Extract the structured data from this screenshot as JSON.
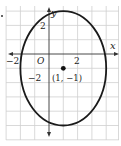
{
  "diagram": {
    "type": "coordinate-graph-ellipse",
    "axes": {
      "x_label": "x",
      "y_label": "y",
      "origin_label": "O",
      "tick_labels": {
        "x_neg": "−2",
        "x_pos": "2",
        "y_pos": "2",
        "y_neg": "−2"
      }
    },
    "center_point": {
      "x": 1,
      "y": -1,
      "label": "(1, −1)"
    },
    "ellipse": {
      "center": [
        1,
        -1
      ],
      "semi_axis_x": 3,
      "semi_axis_y": 4
    },
    "grid": {
      "unit_px": 14.3,
      "color": "#c8c8c8"
    },
    "colors": {
      "curve": "#1a1a1a",
      "axis": "#333333",
      "text": "#222222"
    }
  }
}
